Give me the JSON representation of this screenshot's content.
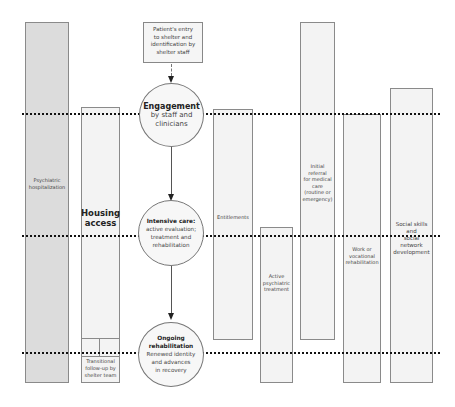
{
  "diagram": {
    "entry_box": {
      "lines": [
        "Patient's entry",
        "to shelter and",
        "identification by",
        "shelter staff"
      ]
    },
    "stages": [
      {
        "title": "Engagement",
        "lines": [
          "by staff and",
          "clinicians"
        ]
      },
      {
        "title": "Intensive care:",
        "lines": [
          "active evaluation;",
          "treatment and",
          "rehabilitation"
        ]
      },
      {
        "title_lines": [
          "Ongoing",
          "rehabilitation"
        ],
        "lines": [
          "Renewed identity",
          "and advances",
          "in recovery"
        ]
      }
    ],
    "columns": {
      "psychiatric": {
        "label": "Psychiatric hospitalization",
        "lines": [
          "Psychiatric",
          "hospitalization"
        ]
      },
      "housing": {
        "title_lines": [
          "Housing",
          "access"
        ],
        "sub_lines": [
          "Transitional",
          "follow-up by",
          "shelter team"
        ]
      },
      "entitlements": {
        "label": "Entitlements"
      },
      "active_psychiatric": {
        "lines": [
          "Active",
          "psychiatric",
          "treatment"
        ]
      },
      "medical_referral": {
        "lines": [
          "Initial",
          "referral",
          "for medical",
          "care",
          "(routine or",
          "emergency)"
        ]
      },
      "vocational": {
        "lines": [
          "Work or",
          "vocational",
          "rehabilitation"
        ]
      },
      "social": {
        "lines": [
          "Social skills",
          "and",
          "social",
          "network",
          "development"
        ]
      }
    },
    "colors": {
      "dark_column": "#dcdcdc",
      "light_column": "#f3f3f3",
      "border": "#8a8a8a",
      "dots": "#111111"
    }
  }
}
